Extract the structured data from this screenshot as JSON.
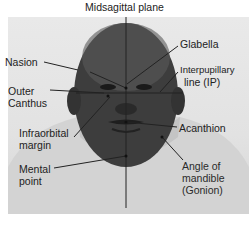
{
  "title": "Midsagittal plane",
  "labels": {
    "nasion": "Nasion",
    "glabella": "Glabella",
    "interpupillary_1": "Interpupillary",
    "interpupillary_2": "line (IP)",
    "outer_canthus_1": "Outer",
    "outer_canthus_2": "Canthus",
    "infraorbital_1": "Infraorbital",
    "infraorbital_2": "margin",
    "acanthion": "Acanthion",
    "mental_1": "Mental",
    "mental_2": "point",
    "gonion_1": "Angle of",
    "gonion_2": "mandible",
    "gonion_3": "(Gonion)"
  },
  "colors": {
    "background": "#ffffff",
    "photo_bg": "#e4e4e4",
    "skin": "#3a3a3a",
    "shirt": "#d2d2d2",
    "line": "#222222"
  }
}
